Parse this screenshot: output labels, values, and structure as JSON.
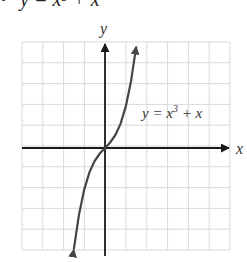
{
  "header": {
    "bullet": "•",
    "text": "y = x³ + x"
  },
  "chart_data": {
    "type": "line",
    "xlabel": "x",
    "ylabel": "y",
    "grid": true,
    "xlim": [
      -4,
      6
    ],
    "ylim": [
      -5,
      5
    ],
    "x": [
      -1.5,
      -1.25,
      -1,
      -0.75,
      -0.5,
      -0.25,
      0,
      0.25,
      0.5,
      0.75,
      1,
      1.25,
      1.5
    ],
    "series": [
      {
        "name": "y = x^3 + x",
        "values": [
          -4.875,
          -3.203,
          -2,
          -1.172,
          -0.625,
          -0.266,
          0,
          0.266,
          0.625,
          1.172,
          2,
          3.203,
          4.875
        ]
      }
    ],
    "annotations": [
      {
        "text": "y = x³ + x",
        "position": "upper right of curve"
      }
    ],
    "colors": {
      "grid": "#d9d9d9",
      "axis": "#1a1a1a",
      "curve": "#444444"
    }
  },
  "labels": {
    "x_axis": "x",
    "y_axis": "y",
    "curve": "y = x",
    "curve_exp": "3",
    "curve_tail": " + x"
  }
}
